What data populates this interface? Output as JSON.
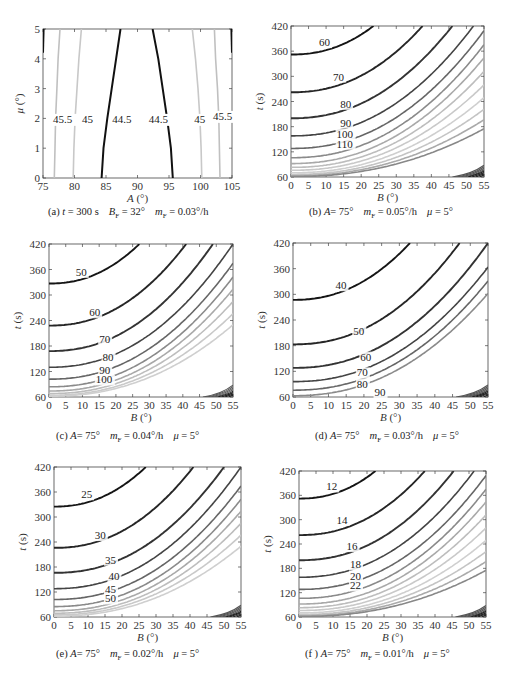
{
  "figure": {
    "panels": [
      {
        "id": "a",
        "caption": {
          "prefix": "(a)",
          "parts": [
            {
              "var": "t",
              "rel": " = ",
              "val": "300 s"
            },
            {
              "var": "B",
              "sub": "F",
              "rel": " = ",
              "val": "32°"
            },
            {
              "var": "m",
              "sub": "F",
              "rel": " = ",
              "val": "0.03°/h"
            }
          ]
        },
        "xlabel": {
          "var": "A",
          "unit": " (°)"
        },
        "ylabel": {
          "var": "μ",
          "unit": " (°)"
        }
      },
      {
        "id": "b",
        "caption": {
          "prefix": "(b)",
          "parts": [
            {
              "var": "A",
              "rel": "= ",
              "val": "75°"
            },
            {
              "var": "m",
              "sub": "F",
              "rel": " = ",
              "val": "0.05°/h"
            },
            {
              "var": "μ",
              "rel": " = ",
              "val": "5°"
            }
          ]
        },
        "xlabel": {
          "var": "B",
          "unit": " (°)"
        },
        "ylabel": {
          "var": "t",
          "unit": " (s)"
        }
      },
      {
        "id": "c",
        "caption": {
          "prefix": "(c)",
          "parts": [
            {
              "var": "A",
              "rel": "= ",
              "val": "75°"
            },
            {
              "var": "m",
              "sub": "F",
              "rel": " = ",
              "val": "0.04°/h"
            },
            {
              "var": "μ",
              "rel": " = ",
              "val": "5°"
            }
          ]
        },
        "xlabel": {
          "var": "B",
          "unit": " (°)"
        },
        "ylabel": {
          "var": "t",
          "unit": " (s)"
        }
      },
      {
        "id": "d",
        "caption": {
          "prefix": "(d)",
          "parts": [
            {
              "var": "A",
              "rel": "= ",
              "val": "75°"
            },
            {
              "var": "m",
              "sub": "F",
              "rel": " = ",
              "val": "0.03°/h"
            },
            {
              "var": "μ",
              "rel": " = ",
              "val": "5°"
            }
          ]
        },
        "xlabel": {
          "var": "B",
          "unit": " (°)"
        },
        "ylabel": {
          "var": "t",
          "unit": " (s)"
        }
      },
      {
        "id": "e",
        "caption": {
          "prefix": "(e)",
          "parts": [
            {
              "var": "A",
              "rel": "= ",
              "val": "75°"
            },
            {
              "var": "m",
              "sub": "F",
              "rel": " = ",
              "val": "0.02°/h"
            },
            {
              "var": "μ",
              "rel": " = ",
              "val": "5°"
            }
          ]
        },
        "xlabel": {
          "var": "B",
          "unit": " (°)"
        },
        "ylabel": {
          "var": "t",
          "unit": " (s)"
        }
      },
      {
        "id": "f",
        "caption": {
          "prefix": "(f )",
          "parts": [
            {
              "var": "A",
              "rel": "= ",
              "val": "75°"
            },
            {
              "var": "m",
              "sub": "F",
              "rel": " = ",
              "val": "0.01°/h"
            },
            {
              "var": "μ",
              "rel": " = ",
              "val": "5°"
            }
          ]
        },
        "xlabel": {
          "var": "B",
          "unit": " (°)"
        },
        "ylabel": {
          "var": "t",
          "unit": " (s)"
        }
      }
    ]
  },
  "chart_data": [
    {
      "id": "a",
      "type": "contour",
      "title": "(a) t = 300 s  B_F = 32°  m_F = 0.03°/h",
      "xlabel": "A (°)",
      "ylabel": "μ (°)",
      "xlim": [
        75,
        105
      ],
      "ylim": [
        0,
        5
      ],
      "xticks": [
        75,
        80,
        85,
        90,
        95,
        100,
        105
      ],
      "yticks": [
        0,
        1,
        2,
        3,
        4,
        5
      ],
      "grid": false,
      "levels": [
        {
          "value": 44.5,
          "label": "44.5",
          "shade": "#111111",
          "curves": [
            [
              [
                84.3,
                0
              ],
              [
                84.6,
                1
              ],
              [
                85.2,
                2
              ],
              [
                85.9,
                3
              ],
              [
                86.6,
                4
              ],
              [
                87.3,
                5
              ]
            ],
            [
              [
                95.6,
                0
              ],
              [
                95.3,
                1
              ],
              [
                94.7,
                2
              ],
              [
                94.0,
                3
              ],
              [
                93.3,
                4
              ],
              [
                92.4,
                5
              ]
            ]
          ],
          "label_pos": [
            [
              86.0,
              1.85
            ],
            [
              91.8,
              1.85
            ]
          ]
        },
        {
          "value": 45,
          "label": "45",
          "shade": "#c8c8c8",
          "curves": [
            [
              [
                79.8,
                0
              ],
              [
                79.9,
                1
              ],
              [
                80.1,
                2
              ],
              [
                80.4,
                3
              ],
              [
                80.7,
                4
              ],
              [
                81.1,
                5
              ]
            ],
            [
              [
                100.2,
                0
              ],
              [
                100.1,
                1
              ],
              [
                99.9,
                2
              ],
              [
                99.6,
                3
              ],
              [
                99.2,
                4
              ],
              [
                98.7,
                5
              ]
            ]
          ],
          "label_pos": [
            [
              81.2,
              1.85
            ],
            [
              99.0,
              1.85
            ]
          ]
        },
        {
          "value": 45.5,
          "label": "45.5",
          "shade": "#c0c0c0",
          "curves": [
            [
              [
                76.8,
                0
              ],
              [
                76.9,
                1
              ],
              [
                77.0,
                2
              ],
              [
                77.2,
                3
              ],
              [
                77.4,
                4
              ],
              [
                77.7,
                5
              ]
            ],
            [
              [
                103.1,
                0
              ],
              [
                103.0,
                1
              ],
              [
                102.9,
                2
              ],
              [
                102.7,
                3
              ],
              [
                102.4,
                4
              ],
              [
                102.2,
                5
              ]
            ]
          ],
          "label_pos": [
            [
              76.6,
              1.85
            ],
            [
              102.0,
              1.95
            ]
          ]
        },
        {
          "value": 46,
          "label": "",
          "shade": "#111111",
          "curves": [
            [
              [
                75.0,
                4.2
              ],
              [
                75.1,
                5
              ]
            ],
            [
              [
                104.9,
                5
              ],
              [
                105.0,
                4.2
              ]
            ]
          ],
          "label_pos": []
        }
      ]
    },
    {
      "id": "b",
      "type": "contour",
      "title": "(b) A = 75°  m_F = 0.05°/h  μ = 5°",
      "xlabel": "B (°)",
      "ylabel": "t (s)",
      "xlim": [
        0,
        55
      ],
      "ylim": [
        60,
        420
      ],
      "xticks": [
        0,
        5,
        10,
        15,
        20,
        25,
        30,
        35,
        40,
        45,
        50,
        55
      ],
      "yticks": [
        60,
        120,
        180,
        240,
        300,
        360,
        420
      ],
      "grid": false,
      "labeled_levels": [
        {
          "value": 60,
          "t_at_B0": 352,
          "B_at_top": 23.5,
          "label_pos": [
            8,
            372
          ]
        },
        {
          "value": 70,
          "t_at_B0": 262,
          "B_at_top": 37.5,
          "label_pos": [
            12,
            290
          ]
        },
        {
          "value": 80,
          "t_at_B0": 200,
          "B_at_top": 46,
          "label_pos": [
            14,
            225
          ]
        },
        {
          "value": 90,
          "t_at_B0": 158,
          "B_at_top": 52,
          "label_pos": [
            14,
            180
          ]
        },
        {
          "value": 100,
          "t_at_B0": 128,
          "B_at_top": 56,
          "label_pos": [
            13,
            153
          ]
        },
        {
          "value": 110,
          "t_at_B0": 106,
          "B_at_top": 59,
          "label_pos": [
            13,
            130
          ]
        }
      ],
      "unlabeled_levels_t_at_B0": [
        92,
        83,
        76,
        70,
        66,
        63,
        61
      ]
    },
    {
      "id": "c",
      "type": "contour",
      "title": "(c) A = 75°  m_F = 0.04°/h  μ = 5°",
      "xlabel": "B (°)",
      "ylabel": "t (s)",
      "xlim": [
        0,
        55
      ],
      "ylim": [
        60,
        420
      ],
      "xticks": [
        0,
        5,
        10,
        15,
        20,
        25,
        30,
        35,
        40,
        45,
        50,
        55
      ],
      "yticks": [
        60,
        120,
        180,
        240,
        300,
        360,
        420
      ],
      "grid": false,
      "labeled_levels": [
        {
          "value": 50,
          "t_at_B0": 327,
          "B_at_top": 27,
          "label_pos": [
            8,
            345
          ]
        },
        {
          "value": 60,
          "t_at_B0": 228,
          "B_at_top": 41,
          "label_pos": [
            12,
            250
          ]
        },
        {
          "value": 70,
          "t_at_B0": 168,
          "B_at_top": 49,
          "label_pos": [
            15,
            188
          ]
        },
        {
          "value": 80,
          "t_at_B0": 130,
          "B_at_top": 55,
          "label_pos": [
            16,
            145
          ]
        },
        {
          "value": 90,
          "t_at_B0": 102,
          "B_at_top": 59,
          "label_pos": [
            15,
            115
          ]
        },
        {
          "value": 100,
          "t_at_B0": 84,
          "B_at_top": 62,
          "label_pos": [
            14,
            92
          ]
        }
      ],
      "unlabeled_levels_t_at_B0": [
        74,
        68,
        64,
        62
      ]
    },
    {
      "id": "d",
      "type": "contour",
      "title": "(d) A = 75°  m_F = 0.03°/h  μ = 5°",
      "xlabel": "B (°)",
      "ylabel": "t (s)",
      "xlim": [
        0,
        55
      ],
      "ylim": [
        60,
        420
      ],
      "xticks": [
        0,
        5,
        10,
        15,
        20,
        25,
        30,
        35,
        40,
        45,
        50,
        55
      ],
      "yticks": [
        60,
        120,
        180,
        240,
        300,
        360,
        420
      ],
      "grid": false,
      "labeled_levels": [
        {
          "value": 40,
          "t_at_B0": 287,
          "B_at_top": 33,
          "label_pos": [
            12,
            312
          ]
        },
        {
          "value": 50,
          "t_at_B0": 183,
          "B_at_top": 47,
          "label_pos": [
            17,
            205
          ]
        },
        {
          "value": 60,
          "t_at_B0": 128,
          "B_at_top": 55,
          "label_pos": [
            19,
            145
          ]
        },
        {
          "value": 70,
          "t_at_B0": 96,
          "B_at_top": 60,
          "label_pos": [
            18,
            108
          ]
        },
        {
          "value": 80,
          "t_at_B0": 76,
          "B_at_top": 63,
          "label_pos": [
            18,
            82
          ]
        },
        {
          "value": 90,
          "t_at_B0": 63,
          "B_at_top": 66,
          "label_pos": [
            23,
            62
          ]
        }
      ],
      "unlabeled_levels_t_at_B0": []
    },
    {
      "id": "e",
      "type": "contour",
      "title": "(e) A = 75°  m_F = 0.02°/h  μ = 5°",
      "xlabel": "B (°)",
      "ylabel": "t (s)",
      "xlim": [
        0,
        55
      ],
      "ylim": [
        60,
        420
      ],
      "xticks": [
        0,
        5,
        10,
        15,
        20,
        25,
        30,
        35,
        40,
        45,
        50,
        55
      ],
      "yticks": [
        60,
        120,
        180,
        240,
        300,
        360,
        420
      ],
      "grid": false,
      "labeled_levels": [
        {
          "value": 25,
          "t_at_B0": 325,
          "B_at_top": 27,
          "label_pos": [
            8,
            345
          ]
        },
        {
          "value": 30,
          "t_at_B0": 226,
          "B_at_top": 41,
          "label_pos": [
            12,
            247
          ]
        },
        {
          "value": 35,
          "t_at_B0": 166,
          "B_at_top": 50,
          "label_pos": [
            15,
            188
          ]
        },
        {
          "value": 40,
          "t_at_B0": 128,
          "B_at_top": 55,
          "label_pos": [
            16,
            148
          ]
        },
        {
          "value": 45,
          "t_at_B0": 102,
          "B_at_top": 59,
          "label_pos": [
            15,
            117
          ]
        },
        {
          "value": 50,
          "t_at_B0": 85,
          "B_at_top": 62,
          "label_pos": [
            15,
            95
          ]
        }
      ],
      "unlabeled_levels_t_at_B0": [
        75,
        69,
        65,
        62
      ]
    },
    {
      "id": "f",
      "type": "contour",
      "title": "(f) A = 75°  m_F = 0.01°/h  μ = 5°",
      "xlabel": "B (°)",
      "ylabel": "t (s)",
      "xlim": [
        0,
        55
      ],
      "ylim": [
        60,
        420
      ],
      "xticks": [
        0,
        5,
        10,
        15,
        20,
        25,
        30,
        35,
        40,
        45,
        50,
        55
      ],
      "yticks": [
        60,
        120,
        180,
        240,
        300,
        360,
        420
      ],
      "grid": false,
      "labeled_levels": [
        {
          "value": 12,
          "t_at_B0": 352,
          "B_at_top": 22.5,
          "label_pos": [
            8,
            372
          ]
        },
        {
          "value": 14,
          "t_at_B0": 262,
          "B_at_top": 37,
          "label_pos": [
            11,
            290
          ]
        },
        {
          "value": 16,
          "t_at_B0": 200,
          "B_at_top": 45.5,
          "label_pos": [
            14,
            225
          ]
        },
        {
          "value": 18,
          "t_at_B0": 158,
          "B_at_top": 51.5,
          "label_pos": [
            15,
            180
          ]
        },
        {
          "value": 20,
          "t_at_B0": 128,
          "B_at_top": 56,
          "label_pos": [
            15,
            152
          ]
        },
        {
          "value": 22,
          "t_at_B0": 106,
          "B_at_top": 59,
          "label_pos": [
            15,
            128
          ]
        }
      ],
      "unlabeled_levels_t_at_B0": [
        92,
        83,
        76,
        70,
        66,
        63,
        61
      ]
    }
  ]
}
